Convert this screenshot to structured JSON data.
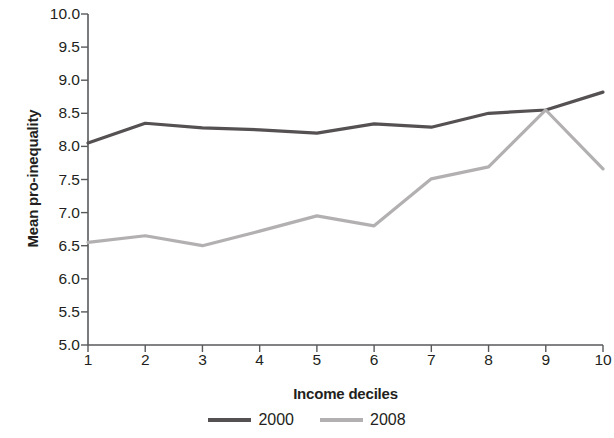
{
  "chart_data": {
    "type": "line",
    "title": "",
    "xlabel": "Income deciles",
    "ylabel": "Mean pro-inequality",
    "categories": [
      "1",
      "2",
      "3",
      "4",
      "5",
      "6",
      "7",
      "8",
      "9",
      "10"
    ],
    "x": [
      1,
      2,
      3,
      4,
      5,
      6,
      7,
      8,
      9,
      10
    ],
    "xlim": [
      1,
      10
    ],
    "ylim": [
      5.0,
      10.0
    ],
    "yticks": [
      "10.0",
      "9.5",
      "9.0",
      "8.5",
      "8.0",
      "7.5",
      "7.0",
      "6.5",
      "6.0",
      "5.5",
      "5.0"
    ],
    "ytick_values": [
      10.0,
      9.5,
      9.0,
      8.5,
      8.0,
      7.5,
      7.0,
      6.5,
      6.0,
      5.5,
      5.0
    ],
    "grid": false,
    "legend_position": "bottom",
    "series": [
      {
        "name": "2000",
        "color": "#555152",
        "values": [
          8.05,
          8.35,
          8.28,
          8.25,
          8.2,
          8.34,
          8.29,
          8.5,
          8.55,
          8.82
        ]
      },
      {
        "name": "2008",
        "color": "#b3b0b1",
        "values": [
          6.55,
          6.65,
          6.5,
          6.72,
          6.95,
          6.8,
          7.51,
          7.69,
          8.55,
          7.66
        ]
      }
    ]
  },
  "axis": {
    "line_color": "#58595b"
  },
  "legend": {
    "items": [
      {
        "label": "2000",
        "color": "#555152"
      },
      {
        "label": "2008",
        "color": "#b3b0b1"
      }
    ]
  }
}
